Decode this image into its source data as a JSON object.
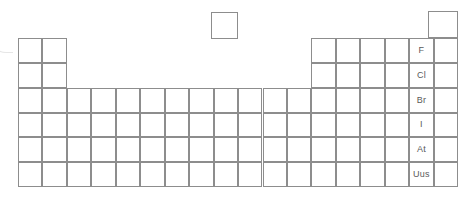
{
  "diagram": {
    "type": "periodic-table-grid",
    "canvas": {
      "width": 467,
      "height": 200,
      "background": "#ffffff"
    },
    "style": {
      "grid_line_color": "#8d8d8d",
      "label_text_color": "#5a5a5a",
      "artifact_color": "#e2e2e2",
      "label_font_size_px": 9
    },
    "geometry": {
      "grid_left": 18,
      "grid_top": 38,
      "grid_right": 458,
      "grid_bottom": 187,
      "columns": 18,
      "rows": 6,
      "cell_width": 24.45,
      "cell_height": 24.85
    },
    "blocks": [
      {
        "name": "s-block-left",
        "columns": [
          1,
          2
        ],
        "rows": [
          1,
          2
        ]
      },
      {
        "name": "main-body",
        "columns": [
          1,
          18
        ],
        "rows": [
          3,
          6
        ]
      },
      {
        "name": "p-block-right",
        "columns": [
          13,
          18
        ],
        "rows": [
          1,
          2
        ]
      }
    ],
    "detached_boxes": [
      {
        "name": "hydrogen-box",
        "x": 211,
        "y": 12,
        "width": 27,
        "height": 27,
        "label": ""
      },
      {
        "name": "helium-box",
        "x": 428,
        "y": 11,
        "width": 30,
        "height": 27,
        "label": ""
      }
    ],
    "labelled_group": {
      "name": "halogens",
      "group_number": 17,
      "column_index": 17,
      "elements": [
        {
          "symbol": "F",
          "period": 1,
          "row_index": 1
        },
        {
          "symbol": "Cl",
          "period": 2,
          "row_index": 2
        },
        {
          "symbol": "Br",
          "period": 3,
          "row_index": 3
        },
        {
          "symbol": "I",
          "period": 4,
          "row_index": 4
        },
        {
          "symbol": "At",
          "period": 5,
          "row_index": 5
        },
        {
          "symbol": "Uus",
          "period": 6,
          "row_index": 6
        }
      ]
    },
    "empty_cell_label": ""
  }
}
